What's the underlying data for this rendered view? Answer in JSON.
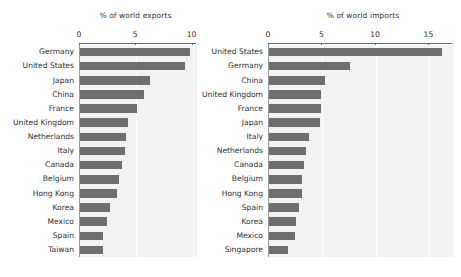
{
  "chart_data": [
    {
      "type": "bar",
      "orientation": "horizontal",
      "title": "% of world exports",
      "xlabel": "",
      "ylabel": "",
      "xlim": [
        0,
        10.4
      ],
      "xticks": [
        0,
        5,
        10
      ],
      "xtick_labels": [
        "0",
        "5",
        "10"
      ],
      "grid": true,
      "legend": "none",
      "bar_color": "#6e6e6e",
      "plot_background": "#f2f2f2",
      "categories": [
        "Germany",
        "United States",
        "Japan",
        "China",
        "France",
        "United Kingdom",
        "Netherlands",
        "Italy",
        "Canada",
        "Belgium",
        "Hong Kong",
        "Korea",
        "Mexico",
        "Spain",
        "Taiwan"
      ],
      "values": [
        9.8,
        9.3,
        6.2,
        5.7,
        5.1,
        4.3,
        4.1,
        4.0,
        3.7,
        3.5,
        3.3,
        2.7,
        2.4,
        2.0,
        2.0
      ]
    },
    {
      "type": "bar",
      "orientation": "horizontal",
      "title": "% of world imports",
      "xlabel": "",
      "ylabel": "",
      "xlim": [
        0,
        17.2
      ],
      "xticks": [
        0,
        5,
        10,
        15
      ],
      "xtick_labels": [
        "0",
        "5",
        "10",
        "15"
      ],
      "grid": true,
      "legend": "none",
      "bar_color": "#6e6e6e",
      "plot_background": "#f2f2f2",
      "categories": [
        "United States",
        "Germany",
        "China",
        "United Kingdom",
        "France",
        "Japan",
        "Italy",
        "Netherlands",
        "Canada",
        "Belgium",
        "Hong Kong",
        "Spain",
        "Korea",
        "Mexico",
        "Singapore"
      ],
      "values": [
        16.2,
        7.6,
        5.2,
        4.9,
        4.9,
        4.8,
        3.7,
        3.5,
        3.3,
        3.1,
        3.1,
        2.8,
        2.5,
        2.4,
        1.8
      ]
    }
  ]
}
